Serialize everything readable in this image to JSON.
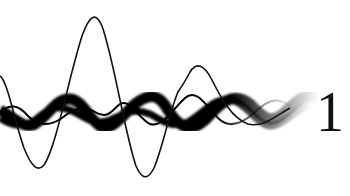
{
  "graphic": {
    "label_digit": "1",
    "colors": {
      "background": "#ffffff",
      "ink": "#111111"
    },
    "waves": [
      {
        "name": "thin-large-wave",
        "stroke_width": 1.6
      },
      {
        "name": "thick-band-wave-a",
        "stroke_width": 11
      },
      {
        "name": "thick-band-wave-b",
        "stroke_width": 7
      },
      {
        "name": "thin-inner-wave",
        "stroke_width": 2
      }
    ]
  }
}
